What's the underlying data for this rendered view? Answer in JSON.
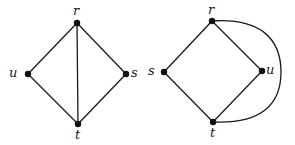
{
  "graphs": [
    {
      "id": "left",
      "nodes": [
        {
          "label": "r",
          "x": 77,
          "y": 23
        },
        {
          "label": "u",
          "x": 28,
          "y": 74
        },
        {
          "label": "s",
          "x": 126,
          "y": 74
        },
        {
          "label": "t",
          "x": 78,
          "y": 124
        }
      ],
      "edges": [
        [
          "r",
          "u"
        ],
        [
          "r",
          "s"
        ],
        [
          "r",
          "t"
        ],
        [
          "u",
          "t"
        ],
        [
          "s",
          "t"
        ]
      ]
    },
    {
      "id": "right",
      "nodes": [
        {
          "label": "r",
          "x": 212,
          "y": 21
        },
        {
          "label": "s",
          "x": 164,
          "y": 72
        },
        {
          "label": "u",
          "x": 262,
          "y": 71
        },
        {
          "label": "t",
          "x": 213,
          "y": 122
        }
      ],
      "edges": [
        [
          "r",
          "s"
        ],
        [
          "r",
          "u"
        ],
        [
          "s",
          "t"
        ],
        [
          "u",
          "t"
        ],
        [
          "r",
          "t",
          "curved"
        ]
      ]
    }
  ],
  "labels": {
    "left_r": "r",
    "left_u": "u",
    "left_s": "s",
    "left_t": "t",
    "right_r": "r",
    "right_s": "s",
    "right_u": "u",
    "right_t": "t"
  },
  "colors": {
    "line": "#1a1a1a",
    "node": "#111111",
    "background": "#ffffff"
  }
}
